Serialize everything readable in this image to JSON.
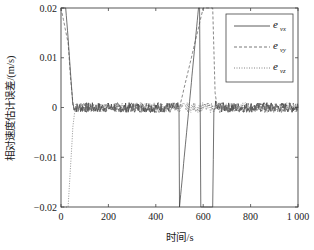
{
  "chart_data": {
    "type": "line",
    "title": "",
    "xlabel": "时间/s",
    "ylabel": "相对速度估计误差/(m/s)",
    "xlim": [
      0,
      1000
    ],
    "ylim": [
      -0.02,
      0.02
    ],
    "x_ticks": [
      0,
      200,
      400,
      600,
      800,
      1000
    ],
    "x_tick_labels": [
      "0",
      "200",
      "400",
      "600",
      "800",
      "1 000"
    ],
    "y_ticks": [
      0.02,
      0.01,
      0,
      -0.01,
      -0.02
    ],
    "y_tick_labels": [
      "0.02",
      "0.01",
      "0",
      "-0.01",
      "-0.02"
    ],
    "grid": false,
    "legend_position": "upper right",
    "series": [
      {
        "name": "e_vx",
        "label_main": "e",
        "label_sub": "vx",
        "style": "solid",
        "description": "Starts off-scale positive, converges to ~0 by t≈50 s; noise ±0.001 around 0; vertical jumps off-scale near t≈500 s, t≈585 s and t≈645 s, reconverging by ~650 s",
        "x": [
          0,
          5,
          10,
          15,
          20,
          30,
          40,
          50,
          60,
          100,
          200,
          300,
          400,
          490,
          498,
          500,
          580,
          585,
          590,
          640,
          645,
          650,
          660,
          700,
          800,
          900,
          1000
        ],
        "y": [
          0.02,
          0.02,
          0.02,
          0.02,
          0.02,
          0.014,
          0.007,
          0.0005,
          0.0,
          0.0,
          0.0,
          0.0,
          0.0,
          0.0,
          0.0,
          -0.02,
          0.02,
          0.02,
          -0.02,
          -0.02,
          -0.001,
          0.0005,
          0.0,
          0.0,
          0.0,
          0.0,
          0.0
        ]
      },
      {
        "name": "e_vy",
        "label_main": "e",
        "label_sub": "vy",
        "style": "dashed",
        "description": "Similar to e_vx; converges to ~0 from above after start and after t≈645 s disturbance",
        "x": [
          0,
          30,
          40,
          50,
          60,
          100,
          200,
          300,
          400,
          500,
          600,
          640,
          650,
          660,
          700,
          800,
          900,
          1000
        ],
        "y": [
          0.02,
          0.013,
          0.006,
          0.0008,
          0.0,
          0.0,
          0.0,
          0.0,
          0.0,
          0.0,
          0.02,
          0.02,
          0.003,
          0.0,
          0.0,
          0.0,
          0.0,
          0.0
        ]
      },
      {
        "name": "e_vz",
        "label_main": "e",
        "label_sub": "vz",
        "style": "dotted",
        "description": "Starts off-scale negative, converges to ~0 by t≈60 s",
        "x": [
          0,
          20,
          30,
          40,
          50,
          60,
          100,
          200,
          300,
          400,
          500,
          600,
          700,
          800,
          900,
          1000
        ],
        "y": [
          -0.02,
          -0.02,
          -0.02,
          -0.012,
          -0.004,
          0.0,
          0.0,
          0.0,
          0.0,
          0.0,
          0.0,
          0.0,
          0.0,
          0.0,
          0.0,
          0.0
        ]
      }
    ],
    "noise_amplitude": 0.001
  },
  "axes": {
    "xlabel": "时间/s",
    "ylabel": "相对速度估计误差/(m/s)"
  },
  "legend": {
    "items": [
      {
        "main": "e",
        "sub": "vx"
      },
      {
        "main": "e",
        "sub": "vy"
      },
      {
        "main": "e",
        "sub": "vz"
      }
    ]
  }
}
